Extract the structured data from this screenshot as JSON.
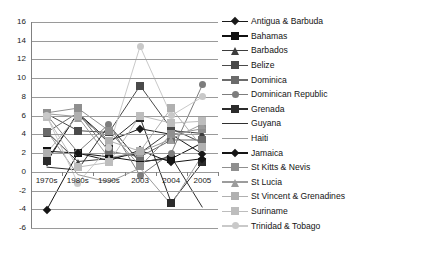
{
  "chart_data": {
    "type": "line",
    "title": "",
    "xlabel": "",
    "ylabel": "",
    "categories": [
      "1970s",
      "1980s",
      "1990s",
      "2003",
      "2004",
      "2005"
    ],
    "ylim": [
      -6,
      16
    ],
    "ytick_step": 2,
    "yticks": [
      16,
      14,
      12,
      10,
      8,
      6,
      4,
      2,
      0,
      -2,
      -4,
      -6
    ],
    "grid": true,
    "legend_position": "right",
    "series": [
      {
        "name": "Antigua & Barbuda",
        "marker": "diamond",
        "color": "#1a1a1a",
        "values": [
          1.0,
          6.3,
          3.3,
          4.6,
          4.0,
          1.9
        ]
      },
      {
        "name": "Bahamas",
        "marker": "square",
        "color": "#111111",
        "values": [
          2.2,
          2.0,
          1.6,
          1.1,
          1.4,
          3.1
        ]
      },
      {
        "name": "Barbados",
        "marker": "triangle",
        "color": "#3d3d3d",
        "values": [
          4.3,
          1.1,
          1.4,
          2.0,
          4.4,
          4.1
        ]
      },
      {
        "name": "Belize",
        "marker": "square",
        "color": "#4a4a4a",
        "values": [
          6.2,
          4.4,
          4.2,
          9.2,
          4.6,
          3.1
        ]
      },
      {
        "name": "Dominica",
        "marker": "square",
        "color": "#6b6b6b",
        "values": [
          4.2,
          6.3,
          2.2,
          1.6,
          3.4,
          3.4
        ]
      },
      {
        "name": "Dominican Republic",
        "marker": "circle",
        "color": "#7d7d7d",
        "values": [
          6.1,
          2.1,
          5.1,
          -0.4,
          2.0,
          9.3
        ]
      },
      {
        "name": "Grenada",
        "marker": "square",
        "color": "#2b2b2b",
        "values": [
          1.2,
          6.2,
          3.1,
          5.8,
          -3.3,
          1.0
        ]
      },
      {
        "name": "Guyana",
        "marker": "none",
        "color": "#2f2f2f",
        "values": [
          0.5,
          0.2,
          5.0,
          1.0,
          1.6,
          -3.8
        ]
      },
      {
        "name": "Haiti",
        "marker": "none",
        "color": "#9a9a9a",
        "values": [
          4.4,
          -0.3,
          -1.1,
          0.4,
          -3.5,
          1.8
        ]
      },
      {
        "name": "Jamaica",
        "marker": "diamond",
        "color": "#151515",
        "values": [
          -4.1,
          2.0,
          1.2,
          2.3,
          1.0,
          1.4
        ]
      },
      {
        "name": "St Kitts & Nevis",
        "marker": "square",
        "color": "#8f8f8f",
        "values": [
          6.3,
          6.8,
          4.4,
          0.6,
          4.0,
          4.6
        ]
      },
      {
        "name": "St Lucia",
        "marker": "triangle",
        "color": "#9c9c9c",
        "values": [
          6.2,
          5.9,
          1.5,
          2.1,
          3.5,
          5.1
        ]
      },
      {
        "name": "St Vincent & Grenadines",
        "marker": "square",
        "color": "#b0b0b0",
        "values": [
          2.0,
          6.0,
          3.3,
          2.2,
          6.8,
          2.6
        ]
      },
      {
        "name": "Suriname",
        "marker": "square",
        "color": "#bdbdbd",
        "values": [
          5.9,
          0.5,
          1.0,
          6.0,
          5.2,
          5.4
        ]
      },
      {
        "name": "Trinidad & Tobago",
        "marker": "circle",
        "color": "#c9c9c9",
        "values": [
          6.0,
          -1.2,
          2.6,
          13.4,
          6.0,
          8.0
        ]
      }
    ]
  },
  "legend": {
    "items": [
      {
        "label": "Antigua & Barbuda"
      },
      {
        "label": "Bahamas"
      },
      {
        "label": "Barbados"
      },
      {
        "label": "Belize"
      },
      {
        "label": "Dominica"
      },
      {
        "label": "Dominican Republic"
      },
      {
        "label": "Grenada"
      },
      {
        "label": "Guyana"
      },
      {
        "label": "Haiti"
      },
      {
        "label": "Jamaica"
      },
      {
        "label": "St Kitts & Nevis"
      },
      {
        "label": "St Lucia"
      },
      {
        "label": "St Vincent & Grenadines"
      },
      {
        "label": "Suriname"
      },
      {
        "label": "Trinidad & Tobago"
      }
    ]
  },
  "axes": {
    "y_tick_labels": [
      "16",
      "14",
      "12",
      "10",
      "8",
      "6",
      "4",
      "2",
      "0",
      "-2",
      "-4",
      "-6"
    ],
    "x_tick_labels": [
      "1970s",
      "1980s",
      "1990s",
      "2003",
      "2004",
      "2005"
    ]
  },
  "colors": {
    "grid": "#9a9a9a",
    "axis": "#808080",
    "text": "#1a1a1a",
    "background": "#ffffff"
  }
}
